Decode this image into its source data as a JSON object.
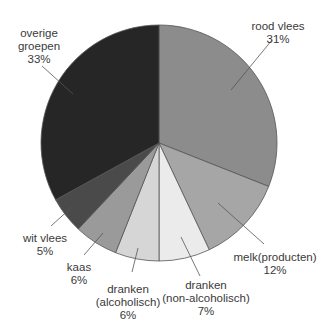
{
  "chart_data": {
    "type": "pie",
    "title": "",
    "start_angle_deg": 0,
    "direction": "clockwise",
    "center": [
      159,
      143
    ],
    "radius": 118,
    "slices": [
      {
        "name": "rood vlees",
        "value": 31,
        "pct_label": "31%",
        "color": "#8c8c8c"
      },
      {
        "name": "melk(producten)",
        "value": 12,
        "pct_label": "12%",
        "color": "#a6a6a6"
      },
      {
        "name": "dranken (non-alcoholisch)",
        "value": 7,
        "pct_label": "7%",
        "color": "#ebebeb"
      },
      {
        "name": "dranken (alcoholisch)",
        "value": 6,
        "pct_label": "6%",
        "color": "#d6d6d6"
      },
      {
        "name": "kaas",
        "value": 6,
        "pct_label": "6%",
        "color": "#9a9a9a"
      },
      {
        "name": "wit vlees",
        "value": 5,
        "pct_label": "5%",
        "color": "#4a4a4a"
      },
      {
        "name": "overige groepen",
        "value": 33,
        "pct_label": "33%",
        "color": "#262626"
      }
    ],
    "labels": [
      {
        "lines": [
          "rood vlees",
          "31%"
        ],
        "x": 278,
        "y": 20,
        "leader": [
          [
            272,
            40
          ],
          [
            231,
            90
          ]
        ]
      },
      {
        "lines": [
          "melk(producten)",
          "12%"
        ],
        "x": 275,
        "y": 251,
        "leader": [
          [
            264,
            244
          ],
          [
            218,
            203
          ]
        ]
      },
      {
        "lines": [
          "dranken",
          "(non-alcoholisch)",
          "7%"
        ],
        "x": 206,
        "y": 279,
        "leader": [
          [
            200,
            276
          ],
          [
            181,
            237
          ]
        ]
      },
      {
        "lines": [
          "dranken",
          "(alcoholisch)",
          "6%"
        ],
        "x": 128,
        "y": 283,
        "leader": [
          [
            132,
            272
          ],
          [
            138,
            248
          ]
        ]
      },
      {
        "lines": [
          "kaas",
          "6%"
        ],
        "x": 79,
        "y": 261,
        "leader": [
          [
            84,
            255
          ],
          [
            103,
            233
          ]
        ]
      },
      {
        "lines": [
          "wit vlees",
          "5%"
        ],
        "x": 45,
        "y": 232,
        "leader": [
          [
            51,
            226
          ],
          [
            72,
            207
          ]
        ]
      },
      {
        "lines": [
          "overige",
          "groepen",
          "33%"
        ],
        "x": 39,
        "y": 27,
        "leader": [
          [
            42,
            66
          ],
          [
            73,
            94
          ]
        ]
      }
    ],
    "legend": "none",
    "grid": false
  }
}
